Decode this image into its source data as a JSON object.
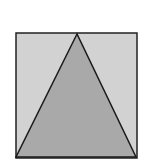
{
  "diagram": {
    "type": "geometry",
    "canvas": {
      "width": 153,
      "height": 164
    },
    "square": {
      "x": 16,
      "y": 33,
      "width": 121,
      "height": 125,
      "fill": "#d2d2d2",
      "stroke": "#222222",
      "stroke_width": 1.5
    },
    "triangle": {
      "points": [
        [
          77,
          34
        ],
        [
          16,
          157
        ],
        [
          136,
          157
        ]
      ],
      "fill": "#a9a9a9",
      "stroke": "#1a1a1a",
      "stroke_width": 1.5
    },
    "labels": []
  }
}
